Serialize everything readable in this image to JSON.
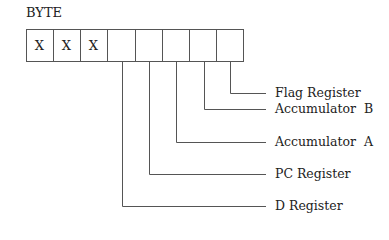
{
  "diagram": {
    "title": "BYTE",
    "cells": [
      "X",
      "X",
      "X",
      "",
      "",
      "",
      "",
      ""
    ],
    "labels": {
      "flag": "Flag Register",
      "acc_b": "Accumulator  B",
      "acc_a": "Accumulator  A",
      "pc": "PC Register",
      "d": "D Register"
    },
    "line_color": "#555555"
  }
}
